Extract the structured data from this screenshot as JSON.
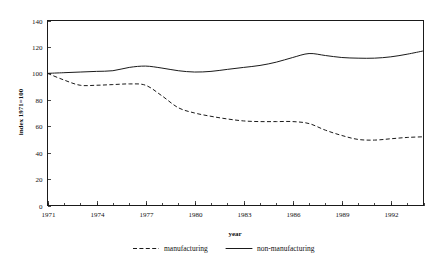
{
  "figure": {
    "background_color": "#ffffff",
    "line_color": "#1a1a1a",
    "clipped_title_fragment": ""
  },
  "axes": {
    "y_axis_title": "index 1971=100",
    "x_axis_title": "year",
    "y_ticks": [
      "0",
      "20",
      "40",
      "60",
      "80",
      "100",
      "120",
      "140"
    ],
    "x_ticks": [
      "1971",
      "1974",
      "1977",
      "1980",
      "1983",
      "1986",
      "1989",
      "1992"
    ]
  },
  "legend": {
    "items": [
      {
        "label": "manufacturing",
        "style": "dashed"
      },
      {
        "label": "non-manufacturing",
        "style": "solid"
      }
    ]
  },
  "chart_data": {
    "type": "line",
    "title": "",
    "xlabel": "year",
    "ylabel": "index 1971=100",
    "xlim": [
      1971,
      1994
    ],
    "ylim": [
      0,
      140
    ],
    "ytick_values": [
      0,
      20,
      40,
      60,
      80,
      100,
      120,
      140
    ],
    "xtick_values": [
      1971,
      1974,
      1977,
      1980,
      1983,
      1986,
      1989,
      1992
    ],
    "xtick_minor_step": 1,
    "grid": false,
    "legend_position": "below-axes",
    "x": [
      1971,
      1972,
      1973,
      1974,
      1975,
      1976,
      1977,
      1978,
      1979,
      1980,
      1981,
      1982,
      1983,
      1984,
      1985,
      1986,
      1987,
      1988,
      1989,
      1990,
      1991,
      1992,
      1993,
      1994
    ],
    "series": [
      {
        "name": "manufacturing",
        "style": "dashed",
        "values": [
          100,
          95,
          91,
          91,
          91.5,
          92,
          91,
          83,
          74,
          70,
          67.5,
          65.5,
          64,
          63.5,
          63.5,
          63.5,
          62,
          57,
          53,
          50,
          49.5,
          50.5,
          51.5,
          52
        ]
      },
      {
        "name": "non-manufacturing",
        "style": "solid",
        "values": [
          100,
          100.5,
          101,
          101.5,
          102,
          104.5,
          105.5,
          104,
          102,
          101,
          101.5,
          103,
          104.5,
          106,
          108.5,
          112,
          115,
          113.5,
          112,
          111.5,
          111.5,
          112.5,
          114.5,
          117
        ]
      }
    ]
  }
}
